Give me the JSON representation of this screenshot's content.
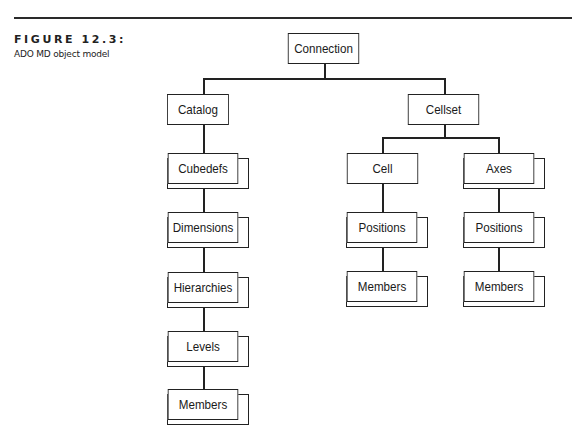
{
  "figure": {
    "label": "FIGURE 12.3:",
    "caption": "ADO MD object model"
  },
  "diagram": {
    "title": "ADO MD object model",
    "nodes": {
      "connection": {
        "label": "Connection",
        "stacked": false
      },
      "catalog": {
        "label": "Catalog",
        "stacked": false
      },
      "cubedefs": {
        "label": "Cubedefs",
        "stacked": true
      },
      "dimensions": {
        "label": "Dimensions",
        "stacked": true
      },
      "hierarchies": {
        "label": "Hierarchies",
        "stacked": true
      },
      "levels": {
        "label": "Levels",
        "stacked": true
      },
      "catalog_members": {
        "label": "Members",
        "stacked": true
      },
      "cellset": {
        "label": "Cellset",
        "stacked": false
      },
      "cell": {
        "label": "Cell",
        "stacked": false
      },
      "axes": {
        "label": "Axes",
        "stacked": true
      },
      "cell_positions": {
        "label": "Positions",
        "stacked": true
      },
      "axes_positions": {
        "label": "Positions",
        "stacked": true
      },
      "cell_members": {
        "label": "Members",
        "stacked": true
      },
      "axes_members": {
        "label": "Members",
        "stacked": true
      }
    },
    "edges": [
      [
        "connection",
        "catalog"
      ],
      [
        "connection",
        "cellset"
      ],
      [
        "catalog",
        "cubedefs"
      ],
      [
        "cubedefs",
        "dimensions"
      ],
      [
        "dimensions",
        "hierarchies"
      ],
      [
        "hierarchies",
        "levels"
      ],
      [
        "levels",
        "catalog_members"
      ],
      [
        "cellset",
        "cell"
      ],
      [
        "cellset",
        "axes"
      ],
      [
        "cell",
        "cell_positions"
      ],
      [
        "cell_positions",
        "cell_members"
      ],
      [
        "axes",
        "axes_positions"
      ],
      [
        "axes_positions",
        "axes_members"
      ]
    ]
  }
}
